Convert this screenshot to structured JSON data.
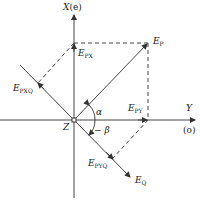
{
  "diagram": {
    "axes": {
      "x_axis": {
        "name": "X",
        "suffix": "(e)"
      },
      "y_axis": {
        "name": "Y",
        "suffix": "(o)"
      },
      "origin": "Z"
    },
    "vectors": {
      "ep": {
        "main": "E",
        "sub": "P"
      },
      "epx": {
        "main": "E",
        "sub": "PX"
      },
      "epy": {
        "main": "E",
        "sub": "PY"
      },
      "eq": {
        "main": "E",
        "sub": "Q"
      },
      "epxq": {
        "main": "E",
        "sub": "PXQ"
      },
      "epyq": {
        "main": "E",
        "sub": "PYQ"
      }
    },
    "angles": {
      "alpha": "α",
      "beta": "− β"
    },
    "colors": {
      "line": "#333333",
      "background": "#ffffff"
    }
  }
}
